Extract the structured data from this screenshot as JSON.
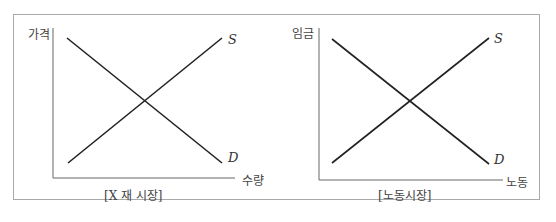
{
  "left_chart": {
    "y_label": "가격",
    "x_label": "수량",
    "caption": "[X 재 시장]",
    "supply_label": "S",
    "demand_label": "D"
  },
  "right_chart": {
    "y_label": "임금",
    "x_label": "노동",
    "caption": "[노동시장]",
    "supply_label": "S",
    "demand_label": "D"
  }
}
